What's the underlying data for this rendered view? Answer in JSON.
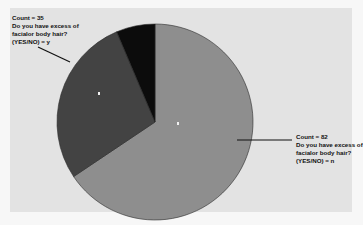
{
  "chart_data": {
    "type": "pie",
    "title": "",
    "categories": [
      "n",
      "y",
      "(unlabeled)"
    ],
    "values": [
      82,
      35,
      8
    ],
    "colors": [
      "#8e8e8e",
      "#434343",
      "#0c0c0c"
    ],
    "start_angle_deg": 0,
    "direction": "clockwise",
    "legend": "none",
    "annotations": [
      {
        "slice": "y",
        "lines": [
          "Count = 35",
          "Do you have excess of",
          "facialor body hair?",
          "(YES/NO) = y"
        ]
      },
      {
        "slice": "n",
        "lines": [
          "Count = 82",
          "Do you have excess of",
          "facialor body hair?",
          "(YES/NO) = n"
        ]
      }
    ]
  },
  "labels": {
    "y": {
      "count": "Count = 35",
      "q1": "Do you have excess of",
      "q2": "facialor body hair?",
      "answer": "(YES/NO) = y"
    },
    "n": {
      "count": "Count = 82",
      "q1": "Do you have excess of",
      "q2": "facialor body hair?",
      "answer": "(YES/NO) = n"
    }
  }
}
